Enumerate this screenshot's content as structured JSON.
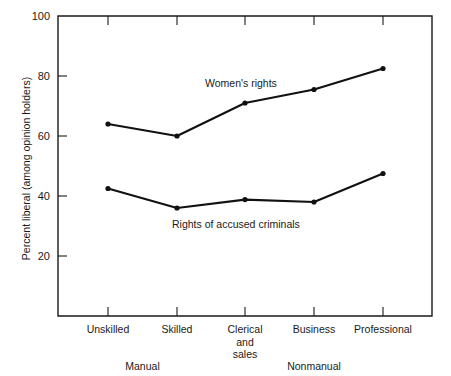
{
  "chart_data": {
    "type": "line",
    "title": "",
    "xlabel": "",
    "ylabel": "Percent liberal (among opinion holders)",
    "ylim": [
      0,
      100
    ],
    "yticks": [
      20,
      40,
      60,
      80,
      100
    ],
    "grid": false,
    "legend_position": "inline-annotation",
    "categories": [
      "Unskilled",
      "Skilled",
      "Clerical and sales",
      "Business",
      "Professional"
    ],
    "category_labels": [
      {
        "line1": "Unskilled",
        "line2": "",
        "line3": ""
      },
      {
        "line1": "Skilled",
        "line2": "",
        "line3": ""
      },
      {
        "line1": "Clerical",
        "line2": "and",
        "line3": "sales"
      },
      {
        "line1": "Business",
        "line2": "",
        "line3": ""
      },
      {
        "line1": "Professional",
        "line2": "",
        "line3": ""
      }
    ],
    "group_labels": [
      "Manual",
      "Nonmanual"
    ],
    "series": [
      {
        "name": "Women's rights",
        "values": [
          64,
          60,
          71,
          75.5,
          82.5
        ]
      },
      {
        "name": "Rights of accused criminals",
        "values": [
          42.5,
          36,
          38.8,
          38,
          47.5
        ]
      }
    ]
  },
  "annotations": {
    "series_one_label": "Women's rights",
    "series_two_label": "Rights of accused criminals"
  }
}
